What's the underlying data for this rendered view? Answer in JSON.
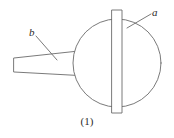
{
  "figure": {
    "caption": "(1)",
    "stroke_color": "#6b6b6b",
    "fill_color": "#ffffff",
    "text_color": "#2b2b2b",
    "background_color": "#ffffff",
    "labels": [
      {
        "id": "a",
        "text": "a",
        "target": "vertical-bar"
      },
      {
        "id": "b",
        "text": "b",
        "target": "tapered-handle"
      }
    ],
    "parts": {
      "sphere": {
        "name": "sphere-body",
        "cx": 117,
        "cy": 63,
        "r": 44
      },
      "bar": {
        "name": "vertical-bar",
        "x": 112,
        "y": 10,
        "width": 10,
        "height": 103
      },
      "handle": {
        "name": "tapered-handle",
        "left_x": 14,
        "right_x": 88,
        "left_top_y": 58,
        "left_bottom_y": 72,
        "right_top_y": 50,
        "right_bottom_y": 76
      },
      "leader_a": {
        "name": "leader-line-a",
        "x1": 151,
        "y1": 14,
        "x2": 127,
        "y2": 28
      },
      "leader_b": {
        "name": "leader-line-b",
        "x1": 36,
        "y1": 36,
        "x2": 57,
        "y2": 60
      }
    }
  }
}
